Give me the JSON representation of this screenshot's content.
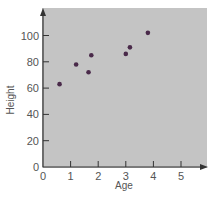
{
  "chart_data": {
    "type": "scatter",
    "title": "",
    "xlabel": "Age",
    "ylabel": "Height",
    "xlim": [
      0,
      5.9
    ],
    "ylim": [
      0,
      117
    ],
    "xticks": [
      0,
      1,
      2,
      3,
      4,
      5
    ],
    "yticks": [
      0,
      20,
      40,
      60,
      80,
      100
    ],
    "grid": false,
    "legend": null,
    "series": [
      {
        "name": "points",
        "points": [
          {
            "x": 0.6,
            "y": 63
          },
          {
            "x": 1.2,
            "y": 78
          },
          {
            "x": 1.65,
            "y": 72
          },
          {
            "x": 1.75,
            "y": 85
          },
          {
            "x": 3.0,
            "y": 86
          },
          {
            "x": 3.15,
            "y": 91
          },
          {
            "x": 3.8,
            "y": 102
          }
        ]
      }
    ],
    "colors": {
      "background": "#c4c4c4",
      "point": "#4a2a4a",
      "axis": "#333333"
    }
  }
}
